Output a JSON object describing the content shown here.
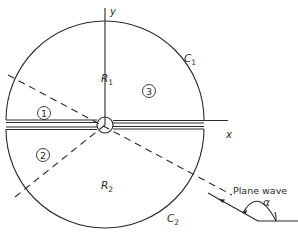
{
  "diagram": {
    "type": "scattering-geometry",
    "axes": {
      "x_label": "x",
      "y_label": "y"
    },
    "regions": {
      "upper": {
        "label": "R",
        "subscript": "1"
      },
      "lower": {
        "label": "R",
        "subscript": "2"
      }
    },
    "contours": {
      "upper": {
        "label": "C",
        "subscript": "1"
      },
      "lower": {
        "label": "C",
        "subscript": "2"
      }
    },
    "zones": [
      {
        "id": "1",
        "label": "1"
      },
      {
        "id": "2",
        "label": "2"
      },
      {
        "id": "3",
        "label": "3"
      }
    ],
    "incident_wave": {
      "label": "Plane wave",
      "angle_label": "α"
    },
    "colors": {
      "stroke": "#2a2a2a",
      "background": "#ffffff"
    }
  }
}
